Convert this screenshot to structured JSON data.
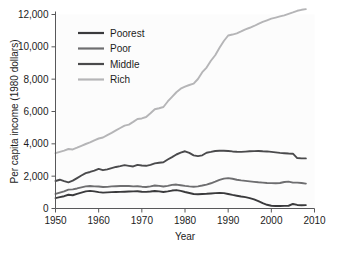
{
  "chart_data": {
    "type": "line",
    "title": "",
    "xlabel": "Year",
    "ylabel": "Per capita income (1980 dollars)",
    "xlim": [
      1950,
      2010
    ],
    "ylim": [
      0,
      12000
    ],
    "xticks": [
      1950,
      1960,
      1970,
      1980,
      1990,
      2000,
      2010
    ],
    "xtick_labels": [
      "1950",
      "1960",
      "1970",
      "1980",
      "1990",
      "2000",
      "2010"
    ],
    "yticks": [
      0,
      2000,
      4000,
      6000,
      8000,
      10000,
      12000
    ],
    "ytick_labels": [
      "0",
      "2,000",
      "4,000",
      "6,000",
      "8,000",
      "10,000",
      "12,000"
    ],
    "grid": false,
    "legend_position": "upper-left",
    "x": [
      1950,
      1951,
      1952,
      1953,
      1954,
      1955,
      1956,
      1957,
      1958,
      1959,
      1960,
      1961,
      1962,
      1963,
      1964,
      1965,
      1966,
      1967,
      1968,
      1969,
      1970,
      1971,
      1972,
      1973,
      1974,
      1975,
      1976,
      1977,
      1978,
      1979,
      1980,
      1981,
      1982,
      1983,
      1984,
      1985,
      1986,
      1987,
      1988,
      1989,
      1990,
      1991,
      1992,
      1993,
      1994,
      1995,
      1996,
      1997,
      1998,
      1999,
      2000,
      2001,
      2002,
      2003,
      2004,
      2005,
      2006,
      2007,
      2008
    ],
    "series": [
      {
        "name": "Poorest",
        "color": "#3a3a3c",
        "values": [
          640,
          700,
          760,
          850,
          820,
          900,
          980,
          1060,
          1090,
          1060,
          1010,
          980,
          1000,
          1010,
          1020,
          1030,
          1040,
          1050,
          1060,
          1070,
          1040,
          1030,
          1050,
          1080,
          1060,
          1020,
          1060,
          1110,
          1140,
          1090,
          1020,
          960,
          900,
          880,
          900,
          910,
          930,
          950,
          960,
          950,
          900,
          840,
          790,
          740,
          700,
          640,
          560,
          450,
          330,
          230,
          170,
          150,
          150,
          160,
          170,
          280,
          220,
          200,
          210
        ]
      },
      {
        "name": "Poor",
        "color": "#6e6e70",
        "values": [
          900,
          980,
          1060,
          1170,
          1180,
          1240,
          1310,
          1370,
          1390,
          1370,
          1360,
          1330,
          1340,
          1370,
          1380,
          1390,
          1400,
          1390,
          1370,
          1380,
          1350,
          1330,
          1370,
          1420,
          1400,
          1360,
          1400,
          1460,
          1480,
          1440,
          1400,
          1370,
          1350,
          1370,
          1420,
          1480,
          1560,
          1660,
          1770,
          1850,
          1880,
          1840,
          1780,
          1740,
          1710,
          1680,
          1650,
          1620,
          1600,
          1580,
          1570,
          1560,
          1580,
          1640,
          1660,
          1600,
          1600,
          1580,
          1540
        ]
      },
      {
        "name": "Middle",
        "color": "#4a4a4c",
        "values": [
          1700,
          1780,
          1690,
          1620,
          1720,
          1880,
          2040,
          2190,
          2260,
          2340,
          2450,
          2370,
          2420,
          2500,
          2570,
          2620,
          2680,
          2640,
          2600,
          2700,
          2660,
          2640,
          2700,
          2790,
          2830,
          2860,
          3030,
          3180,
          3340,
          3450,
          3540,
          3440,
          3290,
          3240,
          3290,
          3450,
          3500,
          3560,
          3570,
          3570,
          3560,
          3530,
          3510,
          3500,
          3520,
          3540,
          3550,
          3560,
          3540,
          3530,
          3500,
          3470,
          3440,
          3420,
          3400,
          3390,
          3120,
          3100,
          3100
        ]
      },
      {
        "name": "Rich",
        "color": "#b5b5b7",
        "values": [
          3420,
          3500,
          3580,
          3680,
          3650,
          3760,
          3880,
          3990,
          4090,
          4220,
          4330,
          4390,
          4540,
          4680,
          4830,
          4980,
          5130,
          5190,
          5360,
          5540,
          5570,
          5660,
          5890,
          6140,
          6200,
          6280,
          6620,
          6910,
          7190,
          7410,
          7540,
          7640,
          7720,
          8010,
          8430,
          8720,
          9140,
          9480,
          9940,
          10360,
          10700,
          10760,
          10830,
          10950,
          11080,
          11180,
          11290,
          11420,
          11540,
          11640,
          11740,
          11810,
          11880,
          11950,
          12040,
          12130,
          12230,
          12290,
          12330
        ]
      }
    ]
  },
  "legend": {
    "items": [
      {
        "label": "Poorest",
        "color": "#3a3a3c"
      },
      {
        "label": "Poor",
        "color": "#6e6e70"
      },
      {
        "label": "Middle",
        "color": "#4a4a4c"
      },
      {
        "label": "Rich",
        "color": "#b5b5b7"
      }
    ]
  }
}
